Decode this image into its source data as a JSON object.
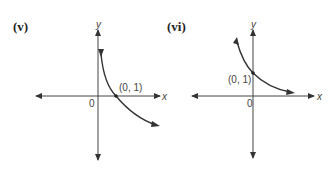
{
  "figures": [
    {
      "label": "(v)",
      "x_axis": "x",
      "y_axis": "y",
      "origin": "0",
      "point_label": "(0, 1)",
      "curve": "decreasing, concave up, asymptotic to x-axis as x increases, crosses x-axis at (0,1) region"
    },
    {
      "label": "(vi)",
      "x_axis": "x",
      "y_axis": "y",
      "origin": "0",
      "point_label": "(0, 1)",
      "curve": "decreasing exponential through y-intercept (0,1)"
    }
  ],
  "colors": {
    "axis": "#444444",
    "curve": "#333333",
    "background": "#ffffff"
  }
}
